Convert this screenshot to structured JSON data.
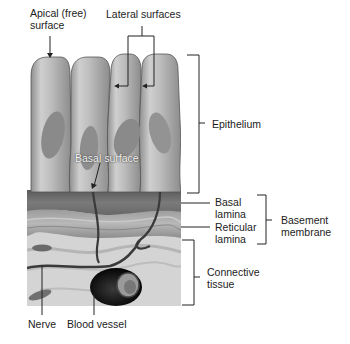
{
  "figure": {
    "labels": {
      "apical_line1": "Apical (free)",
      "apical_line2": "surface",
      "lateral": "Lateral surfaces",
      "epithelium": "Epithelium",
      "basal_surface": "Basal surface",
      "basal_lamina_1": "Basal",
      "basal_lamina_2": "lamina",
      "reticular_lamina_1": "Reticular",
      "reticular_lamina_2": "lamina",
      "basement_1": "Basement",
      "basement_2": "membrane",
      "connective_1": "Connective",
      "connective_2": "tissue",
      "nerve": "Nerve",
      "blood_vessel": "Blood vessel"
    },
    "colors": {
      "cell_fill": "#b9b9b9",
      "cell_highlight": "#e2e2e2",
      "nucleus": "#8a8a8a",
      "basal_lamina": "#6e6e6e",
      "reticular_lamina": "#a8a8a8",
      "connective": "#d6d6d6",
      "line": "#222222"
    }
  }
}
